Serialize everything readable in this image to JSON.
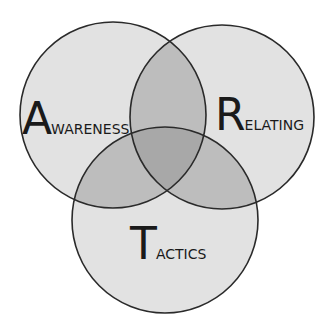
{
  "diagram": {
    "type": "venn",
    "colors": {
      "background": "#ffffff",
      "single": "#e2e2e2",
      "double": "#bdbdbd",
      "triple": "#a8a8a8",
      "stroke": "#2a2a2a"
    },
    "circles": [
      {
        "id": "awareness",
        "label_cap": "A",
        "label_rest": "wareness",
        "label": "Awareness"
      },
      {
        "id": "relating",
        "label_cap": "R",
        "label_rest": "elating",
        "label": "Relating"
      },
      {
        "id": "tactics",
        "label_cap": "T",
        "label_rest": "actics",
        "label": "Tactics"
      }
    ]
  }
}
